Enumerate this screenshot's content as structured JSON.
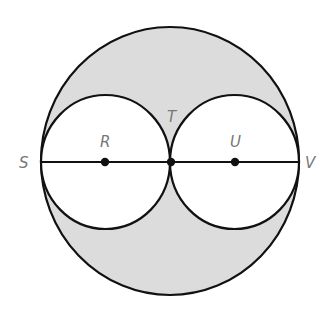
{
  "diagram": {
    "type": "geometry",
    "colors": {
      "shade": "#dcdcdc",
      "stroke": "#111111",
      "label": "#777777",
      "inner_fill": "#ffffff"
    },
    "points": {
      "S": {
        "label": "S"
      },
      "R": {
        "label": "R"
      },
      "T": {
        "label": "T"
      },
      "U": {
        "label": "U"
      },
      "V": {
        "label": "V"
      }
    },
    "segments": [
      "SV"
    ],
    "circles": [
      {
        "name": "outer-circle",
        "center": "T",
        "diameter": "SV"
      },
      {
        "name": "left-circle",
        "center": "R",
        "diameter": "ST"
      },
      {
        "name": "right-circle",
        "center": "U",
        "diameter": "TV"
      }
    ]
  }
}
